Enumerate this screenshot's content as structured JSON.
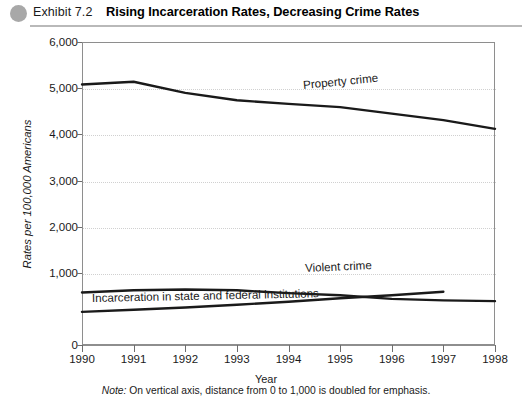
{
  "header": {
    "exhibit_number": "Exhibit 7.2",
    "title": "Rising Incarceration Rates, Decreasing Crime Rates",
    "bullet_color": "#a8a8a8"
  },
  "footnote": {
    "lead": "Note:",
    "text": " On vertical axis, distance from 0 to 1,000 is doubled for emphasis."
  },
  "chart_data": {
    "type": "line",
    "title": "Rising Incarceration Rates, Decreasing Crime Rates",
    "xlabel": "Year",
    "ylabel": "Rates per 100,000 Americans",
    "x": [
      1990,
      1991,
      1992,
      1993,
      1994,
      1995,
      1996,
      1997,
      1998
    ],
    "xtick_labels": [
      "1990",
      "1991",
      "1992",
      "1993",
      "1994",
      "1995",
      "1996",
      "1997",
      "1998"
    ],
    "ytick_labels": [
      "0",
      "1,000",
      "2,000",
      "3,000",
      "4,000",
      "5,000",
      "6,000"
    ],
    "ytick_values": [
      0,
      1000,
      2000,
      3000,
      4000,
      5000,
      6000
    ],
    "ylim": [
      0,
      6000
    ],
    "xlim": [
      1990,
      1998
    ],
    "grid": true,
    "grid_style": "dotted-horizontal",
    "legend_position": "inline-labels",
    "axis_note": "On vertical axis, distance from 0 to 1,000 is doubled for emphasis.",
    "line_color": "#1a1a1a",
    "series": [
      {
        "name": "Property crime",
        "label": "Property crime",
        "x": [
          1990,
          1991,
          1992,
          1993,
          1994,
          1995,
          1996,
          1997,
          1998
        ],
        "values": [
          5080,
          5140,
          4900,
          4740,
          4660,
          4590,
          4450,
          4310,
          4120
        ]
      },
      {
        "name": "Violent crime",
        "label": "Violent crime",
        "x": [
          1990,
          1991,
          1992,
          1993,
          1994,
          1995,
          1996,
          1997,
          1998
        ],
        "values": [
          730,
          760,
          770,
          760,
          720,
          690,
          640,
          620,
          610
        ]
      },
      {
        "name": "Incarceration in state and federal institutions",
        "label": "Incarceration in state and federal institutions",
        "x": [
          1990,
          1991,
          1992,
          1993,
          1994,
          1995,
          1996,
          1997
        ],
        "values": [
          460,
          490,
          520,
          560,
          600,
          650,
          690,
          740
        ]
      }
    ]
  }
}
